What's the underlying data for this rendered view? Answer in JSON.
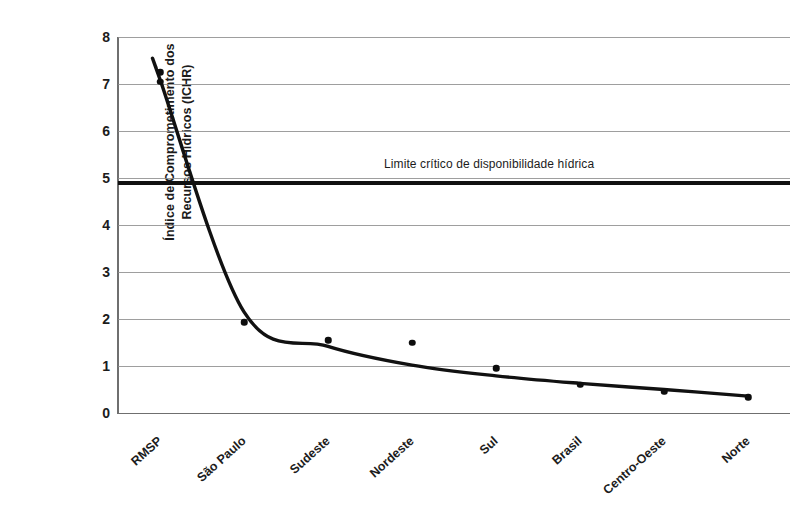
{
  "chart_data": {
    "type": "scatter",
    "title": "",
    "xlabel": "",
    "ylabel_lines": [
      "Índice de Comprometimento dos",
      "Recursos Hídricos (ICHR)"
    ],
    "ylabel": "Índice de Comprometimento dos Recursos Hídricos (ICHR)",
    "categories": [
      "RMSP",
      "São Paulo",
      "Sudeste",
      "Nordeste",
      "Sul",
      "Brasil",
      "Centro-Oeste",
      "Norte"
    ],
    "values": [
      7.25,
      1.93,
      1.55,
      1.5,
      0.95,
      0.6,
      0.45,
      0.33
    ],
    "extra_points": [
      {
        "category": "RMSP",
        "value": 7.05
      }
    ],
    "series": [
      {
        "name": "ICHR",
        "values": [
          7.25,
          1.93,
          1.55,
          1.5,
          0.95,
          0.6,
          0.45,
          0.33
        ]
      }
    ],
    "fit_curve": {
      "name": "curva de ajuste",
      "type": "power-decay",
      "values": [
        7.1,
        2.15,
        1.42,
        1.02,
        0.79,
        0.63,
        0.5,
        0.36
      ]
    },
    "threshold": {
      "label": "Limite crítico de disponibilidade hídrica",
      "value": 4.9
    },
    "ylim": [
      0,
      8
    ],
    "yticks": [
      "0",
      "1",
      "2",
      "3",
      "4",
      "5",
      "6",
      "7",
      "8"
    ],
    "grid": "horizontal",
    "legend": "none",
    "colors": {
      "marker": "#0d0d0d",
      "curve": "#111111",
      "threshold": "#111111",
      "grid": "#8d8d8d",
      "axis": "#6f6f6f",
      "text": "#1c1c1c",
      "background": "#ffffff"
    }
  }
}
